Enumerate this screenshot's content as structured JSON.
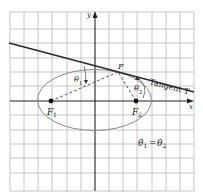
{
  "figure": {
    "type": "ellipse-reflection-property",
    "axes": {
      "x_label": "x",
      "y_label": "y"
    },
    "labels": {
      "point_p": "P",
      "tangent": "Tangent T",
      "focus1_letter": "F",
      "focus1_sub": "1",
      "focus2_letter": "F",
      "focus2_sub": "2",
      "theta1_letter": "θ",
      "theta1_sub": "1",
      "theta2_letter": "θ",
      "theta2_sub": "2",
      "equation": {
        "lhs_letter": "θ",
        "lhs_sub": "1",
        "eq": "=",
        "rhs_letter": "θ",
        "rhs_sub": "2"
      }
    },
    "colors": {
      "grid": "#b8b8b8",
      "axes": "#222222",
      "tangent": "#2a2a2a",
      "ellipse": "#8a8a8a",
      "dashed": "#444444",
      "foci": "#111111"
    }
  }
}
